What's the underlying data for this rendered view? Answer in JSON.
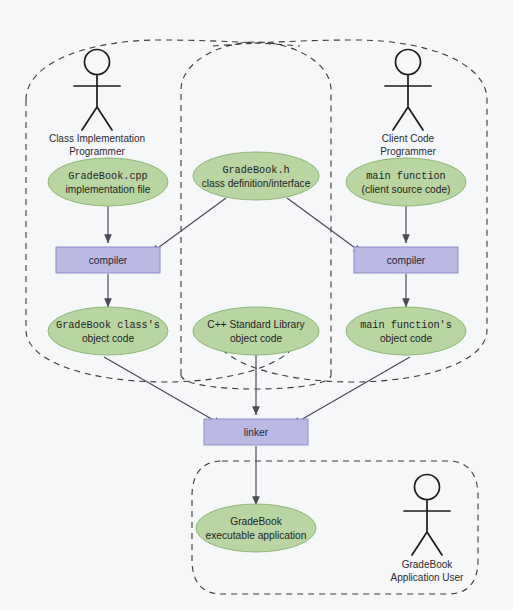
{
  "diagram": {
    "background_color": "#f5f7f9",
    "ellipse_fill": "#b9d6a2",
    "ellipse_stroke": "#8cb874",
    "box_fill": "#b9b9e3",
    "box_stroke": "#8e8ec8",
    "connector_color": "#4a4a55",
    "region_stroke": "#3a3a3a"
  },
  "actors": [
    {
      "id": "class-impl-programmer",
      "line1": "Class Implementation",
      "line2": "Programmer"
    },
    {
      "id": "client-code-programmer",
      "line1": "Client Code",
      "line2": "Programmer"
    },
    {
      "id": "gradebook-application-user",
      "line1": "GradeBook",
      "line2": "Application User"
    }
  ],
  "ellipses": [
    {
      "id": "gradebook-cpp",
      "line1": "GradeBook.cpp",
      "line2": "implementation file",
      "mono1": true
    },
    {
      "id": "gradebook-h",
      "line1": "GradeBook.h",
      "line2": "class definition/interface",
      "mono1": true
    },
    {
      "id": "main-function",
      "line1": "main function",
      "line2": "(client source code)",
      "mono1": true
    },
    {
      "id": "gradebook-class-object-code",
      "line1": "GradeBook class's",
      "line2": "object code",
      "mono1": true
    },
    {
      "id": "cpp-standard-library-object-code",
      "line1": "C++ Standard Library",
      "line2": "object code",
      "mono1": false
    },
    {
      "id": "main-function-object-code",
      "line1": "main function's",
      "line2": "object code",
      "mono1": true
    },
    {
      "id": "gradebook-executable",
      "line1": "GradeBook",
      "line2": "executable application",
      "mono1": false
    }
  ],
  "boxes": [
    {
      "id": "compiler-left",
      "label": "compiler"
    },
    {
      "id": "compiler-right",
      "label": "compiler"
    },
    {
      "id": "linker",
      "label": "linker"
    }
  ],
  "regions": [
    {
      "id": "region-class-implementation",
      "label": ""
    },
    {
      "id": "region-class-interface",
      "label": ""
    },
    {
      "id": "region-client-code",
      "label": ""
    },
    {
      "id": "region-application-user",
      "label": ""
    }
  ]
}
